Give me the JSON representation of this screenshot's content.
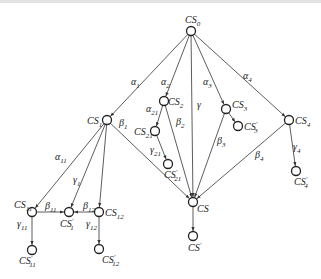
{
  "diagram": {
    "type": "directed-tree",
    "nodes": [
      {
        "id": "CS0",
        "base": "CS",
        "sub": "0",
        "prime": false,
        "x": 191,
        "y": 31,
        "lx": 185,
        "ly": 23,
        "anchor": "start"
      },
      {
        "id": "CS1",
        "base": "CS",
        "sub": "1",
        "prime": false,
        "x": 107,
        "y": 120,
        "lx": 87,
        "ly": 124,
        "anchor": "start"
      },
      {
        "id": "CS2",
        "base": "CS",
        "sub": "2",
        "prime": false,
        "x": 164,
        "y": 101,
        "lx": 168,
        "ly": 105,
        "anchor": "start"
      },
      {
        "id": "CS21",
        "base": "CS",
        "sub": "21",
        "prime": false,
        "x": 155,
        "y": 131,
        "lx": 134,
        "ly": 135,
        "anchor": "start"
      },
      {
        "id": "CS21p",
        "base": "CS",
        "sub": "21",
        "prime": true,
        "x": 168,
        "y": 164,
        "lx": 164,
        "ly": 178,
        "anchor": "start"
      },
      {
        "id": "CS3",
        "base": "CS",
        "sub": "3",
        "prime": false,
        "x": 226,
        "y": 109,
        "lx": 232,
        "ly": 108,
        "anchor": "start"
      },
      {
        "id": "CS3p",
        "base": "CS",
        "sub": "3",
        "prime": true,
        "x": 238,
        "y": 126,
        "lx": 244,
        "ly": 130,
        "anchor": "start"
      },
      {
        "id": "CS4",
        "base": "CS",
        "sub": "4",
        "prime": false,
        "x": 289,
        "y": 120,
        "lx": 295,
        "ly": 124,
        "anchor": "start"
      },
      {
        "id": "CS4p",
        "base": "CS",
        "sub": "4",
        "prime": true,
        "x": 296,
        "y": 171,
        "lx": 294,
        "ly": 185,
        "anchor": "start"
      },
      {
        "id": "CS",
        "base": "CS",
        "sub": "",
        "prime": false,
        "x": 193,
        "y": 202,
        "lx": 197,
        "ly": 212,
        "anchor": "start"
      },
      {
        "id": "CSp",
        "base": "CS",
        "sub": "",
        "prime": true,
        "x": 193,
        "y": 236,
        "lx": 188,
        "ly": 251,
        "anchor": "start"
      },
      {
        "id": "CS11",
        "base": "CS",
        "sub": "11",
        "prime": false,
        "x": 32,
        "y": 212,
        "lx": 14,
        "ly": 208,
        "anchor": "start"
      },
      {
        "id": "CS11p",
        "base": "CS",
        "sub": "11",
        "prime": true,
        "x": 32,
        "y": 250,
        "lx": 19,
        "ly": 264,
        "anchor": "start"
      },
      {
        "id": "CS1p",
        "base": "CS",
        "sub": "1",
        "prime": true,
        "x": 69,
        "y": 212,
        "lx": 60,
        "ly": 227,
        "anchor": "start"
      },
      {
        "id": "CS12",
        "base": "CS",
        "sub": "12",
        "prime": false,
        "x": 99,
        "y": 212,
        "lx": 105,
        "ly": 216,
        "anchor": "start"
      },
      {
        "id": "CS12p",
        "base": "CS",
        "sub": "12",
        "prime": true,
        "x": 99,
        "y": 249,
        "lx": 102,
        "ly": 263,
        "anchor": "start"
      }
    ],
    "edges": [
      {
        "from": "CS0",
        "to": "CS1",
        "label": "α",
        "sub": "1",
        "lx": 131,
        "ly": 85
      },
      {
        "from": "CS0",
        "to": "CS2",
        "label": "α",
        "sub": "2",
        "lx": 161,
        "ly": 85
      },
      {
        "from": "CS0",
        "to": "CS",
        "label": "γ",
        "sub": "",
        "lx": 197,
        "ly": 108
      },
      {
        "from": "CS0",
        "to": "CS3",
        "label": "α",
        "sub": "3",
        "lx": 203,
        "ly": 85
      },
      {
        "from": "CS0",
        "to": "CS4",
        "label": "α",
        "sub": "4",
        "lx": 243,
        "ly": 79
      },
      {
        "from": "CS2",
        "to": "CS21",
        "label": "α",
        "sub": "21",
        "lx": 146,
        "ly": 112
      },
      {
        "from": "CS2",
        "to": "CS",
        "label": "β",
        "sub": "2",
        "lx": 176,
        "ly": 125
      },
      {
        "from": "CS21",
        "to": "CS21p",
        "label": "γ",
        "sub": "21",
        "lx": 150,
        "ly": 153
      },
      {
        "from": "CS1",
        "to": "CS",
        "label": "β",
        "sub": "1",
        "lx": 119,
        "ly": 126
      },
      {
        "from": "CS3",
        "to": "CS3p",
        "label": "",
        "sub": "",
        "lx": 0,
        "ly": 0
      },
      {
        "from": "CS3",
        "to": "CS",
        "label": "β",
        "sub": "3",
        "lx": 217,
        "ly": 144
      },
      {
        "from": "CS4",
        "to": "CS",
        "label": "β",
        "sub": "4",
        "lx": 255,
        "ly": 158
      },
      {
        "from": "CS4",
        "to": "CS4p",
        "label": "γ",
        "sub": "4",
        "lx": 293,
        "ly": 150
      },
      {
        "from": "CS",
        "to": "CSp",
        "label": "",
        "sub": "",
        "lx": 0,
        "ly": 0
      },
      {
        "from": "CS1",
        "to": "CS11",
        "label": "α",
        "sub": "11",
        "lx": 55,
        "ly": 160
      },
      {
        "from": "CS1",
        "to": "CS1p",
        "label": "γ",
        "sub": "1",
        "lx": 73,
        "ly": 183
      },
      {
        "from": "CS1",
        "to": "CS12",
        "label": "",
        "sub": "",
        "lx": 0,
        "ly": 0
      },
      {
        "from": "CS11",
        "to": "CS1p",
        "label": "β",
        "sub": "11",
        "lx": 45,
        "ly": 209
      },
      {
        "from": "CS12",
        "to": "CS1p",
        "label": "β",
        "sub": "12",
        "lx": 83,
        "ly": 209
      },
      {
        "from": "CS11",
        "to": "CS11p",
        "label": "γ",
        "sub": "11",
        "lx": 17,
        "ly": 227
      },
      {
        "from": "CS12",
        "to": "CS12p",
        "label": "γ",
        "sub": "12",
        "lx": 86,
        "ly": 227
      }
    ]
  }
}
